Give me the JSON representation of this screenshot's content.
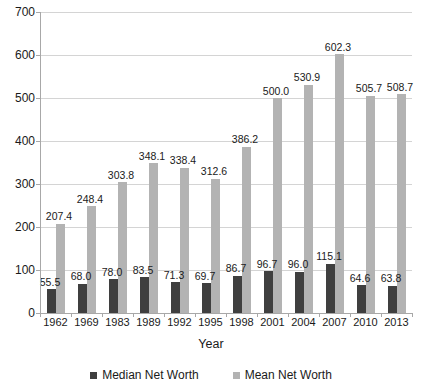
{
  "chart_data": {
    "type": "bar",
    "title": "",
    "xlabel": "Year",
    "ylabel": "",
    "ylim": [
      0,
      700
    ],
    "yticks": [
      0,
      100,
      200,
      300,
      400,
      500,
      600,
      700
    ],
    "grid": true,
    "legend_position": "bottom",
    "categories": [
      "1962",
      "1969",
      "1983",
      "1989",
      "1992",
      "1995",
      "1998",
      "2001",
      "2004",
      "2007",
      "2010",
      "2013"
    ],
    "series": [
      {
        "name": "Median Net Worth",
        "color": "#3f3f3f",
        "values": [
          55.5,
          68.0,
          78.0,
          83.5,
          71.3,
          69.7,
          86.7,
          96.7,
          96.0,
          115.1,
          64.6,
          63.8
        ],
        "labels": [
          "55.5",
          "68.0",
          "78.0",
          "83.5",
          "71.3",
          "69.7",
          "86.7",
          "96.7",
          "96.0",
          "115.1",
          "64.6",
          "63.8"
        ]
      },
      {
        "name": "Mean Net Worth",
        "color": "#b3b3b3",
        "values": [
          207.4,
          248.4,
          303.8,
          348.1,
          338.4,
          312.6,
          386.2,
          500.0,
          530.9,
          602.3,
          505.7,
          508.7
        ],
        "labels": [
          "207.4",
          "248.4",
          "303.8",
          "348.1",
          "338.4",
          "312.6",
          "386.2",
          "500.0",
          "530.9",
          "602.3",
          "505.7",
          "508.7"
        ]
      }
    ]
  },
  "axis": {
    "x_title": "Year",
    "y_tick_labels": [
      "700",
      "600",
      "500",
      "400",
      "300",
      "200",
      "100",
      "0"
    ]
  },
  "legend": {
    "items": [
      {
        "label": "Median Net Worth",
        "color": "#3f3f3f"
      },
      {
        "label": "Mean Net Worth",
        "color": "#b3b3b3"
      }
    ]
  }
}
